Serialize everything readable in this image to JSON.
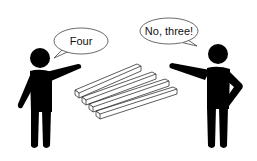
{
  "scene": {
    "description": "Two stick figures disagree about an impossible-object illusion of bars",
    "left_figure": {
      "speech": "Four"
    },
    "right_figure": {
      "speech": "No, three!"
    },
    "illusion": {
      "name": "impossible-bars",
      "visible_bar_ends_front": 4,
      "visible_bar_ends_back": 3
    }
  },
  "colors": {
    "figure": "#000000",
    "background": "#ffffff",
    "outline": "#333333"
  }
}
